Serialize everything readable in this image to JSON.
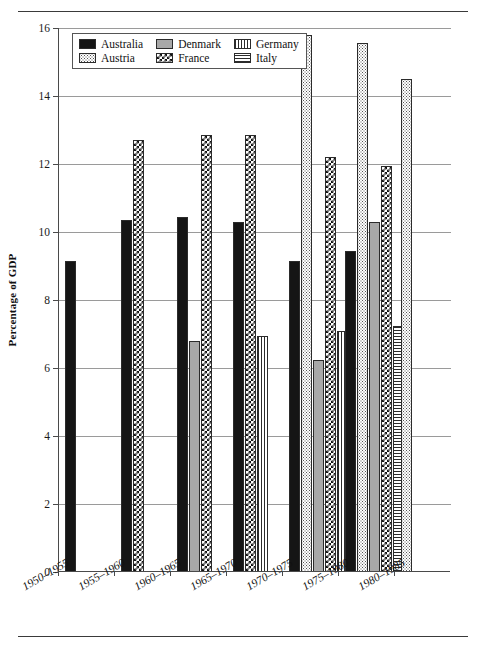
{
  "chart_data": {
    "type": "bar",
    "title": "",
    "xlabel": "",
    "ylabel": "Percentage of GDP",
    "ylim": [
      0,
      16
    ],
    "yticks": [
      0,
      2,
      4,
      6,
      8,
      10,
      12,
      14,
      16
    ],
    "grid": true,
    "legend_position": "top-left-inside",
    "categories": [
      "1950–1955",
      "1955–1960",
      "1960–1965",
      "1965–1970",
      "1970–1975",
      "1975–1980",
      "1980–1985"
    ],
    "series": [
      {
        "name": "Australia",
        "pattern": "solid-black",
        "color": "#151515",
        "values": [
          9.15,
          10.35,
          10.45,
          10.3,
          9.15,
          9.45,
          null
        ]
      },
      {
        "name": "Austria",
        "pattern": "dotted-stipple",
        "color": "#ffffff",
        "values": [
          null,
          null,
          null,
          null,
          15.8,
          15.55,
          14.5
        ]
      },
      {
        "name": "Denmark",
        "pattern": "solid-gray",
        "color": "#a8a8a8",
        "values": [
          null,
          null,
          6.8,
          null,
          6.25,
          10.3,
          null
        ]
      },
      {
        "name": "France",
        "pattern": "checkered",
        "color": "#ffffff",
        "values": [
          null,
          12.7,
          12.85,
          12.85,
          12.2,
          11.95,
          null
        ]
      },
      {
        "name": "Germany",
        "pattern": "vertical-stripes",
        "color": "#ffffff",
        "values": [
          null,
          null,
          null,
          6.95,
          7.1,
          null,
          null
        ]
      },
      {
        "name": "Italy",
        "pattern": "horizontal-stripes",
        "color": "#ffffff",
        "values": [
          null,
          null,
          null,
          null,
          null,
          7.25,
          null
        ]
      }
    ]
  },
  "legend": {
    "items": [
      {
        "label": "Australia",
        "pattern": "pat-australia"
      },
      {
        "label": "Austria",
        "pattern": "pat-austria"
      },
      {
        "label": "Denmark",
        "pattern": "pat-denmark"
      },
      {
        "label": "France",
        "pattern": "pat-france"
      },
      {
        "label": "Germany",
        "pattern": "pat-germany"
      },
      {
        "label": "Italy",
        "pattern": "pat-italy"
      }
    ]
  }
}
